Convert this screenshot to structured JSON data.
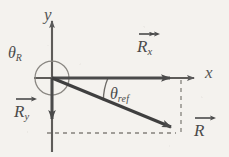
{
  "figure": {
    "kind": "vector-decomposition-diagram",
    "background_color": "#f4f2ee",
    "stroke_color": "#555555",
    "vector_color": "#4a4a4a",
    "dashed_color": "#7d7a75",
    "width": 229,
    "height": 157
  },
  "axes": {
    "origin": {
      "x": 52,
      "y": 78
    },
    "x_axis": {
      "label": "x",
      "label_x": 205,
      "label_y": 64,
      "from_x": 34,
      "to_x": 197,
      "y": 78
    },
    "y_axis": {
      "label": "y",
      "label_x": 44,
      "label_y": 6,
      "x": 52,
      "from_y": 152,
      "to_y": 18
    }
  },
  "vectors": [
    {
      "id": "Rx",
      "name": "x-component-vector",
      "symbol": "R",
      "subscript": "x",
      "label_x": 137,
      "label_y": 36,
      "from": {
        "x": 52,
        "y": 78
      },
      "to": {
        "x": 180,
        "y": 78
      }
    },
    {
      "id": "Ry",
      "name": "y-component-vector",
      "symbol": "R",
      "subscript": "y",
      "label_x": 14,
      "label_y": 101,
      "from": {
        "x": 52,
        "y": 78
      },
      "to": {
        "x": 52,
        "y": 128
      }
    },
    {
      "id": "R",
      "name": "resultant-vector",
      "symbol": "R",
      "subscript": "",
      "label_x": 192,
      "label_y": 119,
      "from": {
        "x": 52,
        "y": 78
      },
      "to": {
        "x": 180,
        "y": 131
      }
    }
  ],
  "angles": [
    {
      "id": "theta_R",
      "name": "standard-angle",
      "symbol": "θ",
      "subscript": "R",
      "label_x": 8,
      "label_y": 44,
      "arc": {
        "cx": 52,
        "cy": 78,
        "r": 17
      },
      "description": "full circle arc about origin"
    },
    {
      "id": "theta_ref",
      "name": "reference-angle",
      "symbol": "θ",
      "subscript": "ref",
      "label_x": 110,
      "label_y": 86,
      "arc": {
        "cx": 52,
        "cy": 78,
        "r": 56
      },
      "description": "arc from positive x-axis down to resultant"
    }
  ],
  "guides": [
    {
      "id": "vertical-dashed",
      "name": "vertical-projection-guide",
      "x1": 181,
      "y1": 78,
      "x2": 181,
      "y2": 134
    },
    {
      "id": "horizontal-dashed",
      "name": "horizontal-projection-guide",
      "x1": 48,
      "y1": 133,
      "x2": 182,
      "y2": 133
    }
  ]
}
